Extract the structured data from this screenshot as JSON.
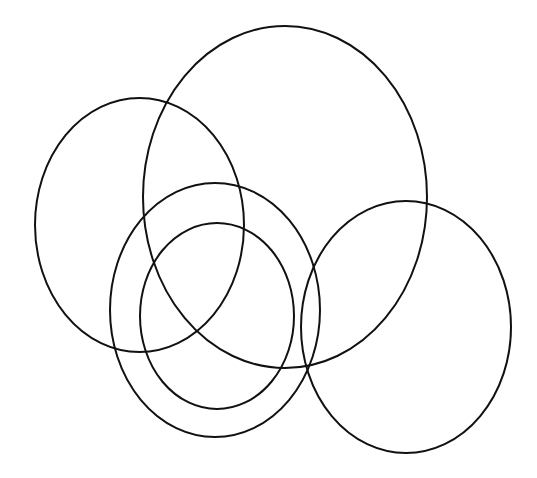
{
  "diagram": {
    "type": "overlapping-ellipses",
    "background": "#ffffff",
    "stroke_color": "#111111",
    "stroke_width": 2,
    "shapes": [
      {
        "name": "left-ellipse",
        "cx": 139.5,
        "cy": 225,
        "rx": 104.5,
        "ry": 127
      },
      {
        "name": "large-top-ellipse",
        "cx": 285,
        "cy": 197,
        "rx": 142,
        "ry": 171
      },
      {
        "name": "middle-outer-ellipse",
        "cx": 215,
        "cy": 310,
        "rx": 105,
        "ry": 127
      },
      {
        "name": "middle-inner-ellipse",
        "cx": 217,
        "cy": 316,
        "rx": 77,
        "ry": 93
      },
      {
        "name": "right-ellipse",
        "cx": 406,
        "cy": 327,
        "rx": 105,
        "ry": 126
      }
    ]
  }
}
